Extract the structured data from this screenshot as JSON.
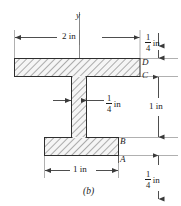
{
  "figure": {
    "caption": "(b)",
    "axis_label": "y"
  },
  "points": [
    {
      "name": "point-d",
      "label": "D"
    },
    {
      "name": "point-c",
      "label": "C"
    },
    {
      "name": "point-b",
      "label": "B"
    },
    {
      "name": "point-a",
      "label": "A"
    }
  ],
  "dimensions": {
    "top_width": {
      "label": "2 in",
      "value": 2,
      "unit": "in"
    },
    "top_flange_thickness": {
      "numerator": "1",
      "denominator": "4",
      "unit": "in",
      "value": 0.25
    },
    "web_thickness": {
      "numerator": "1",
      "denominator": "4",
      "unit": "in",
      "value": 0.25
    },
    "web_height": {
      "label": "1 in",
      "value": 1,
      "unit": "in"
    },
    "bottom_width": {
      "label": "1 in",
      "value": 1,
      "unit": "in"
    },
    "bottom_flange_thickness": {
      "numerator": "1",
      "denominator": "4",
      "unit": "in",
      "value": 0.25
    }
  },
  "colors": {
    "line": "#3a3a3a",
    "hatch": "#555555",
    "section_fill": "#f2f2f2",
    "text": "#1a1a1a",
    "background": "#ffffff"
  }
}
